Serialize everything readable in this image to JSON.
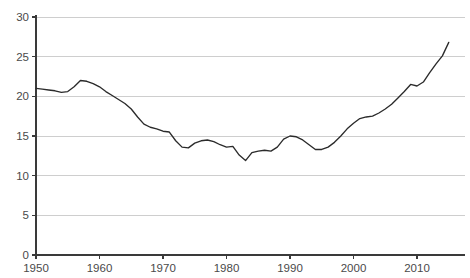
{
  "chart_data": {
    "type": "line",
    "title": "",
    "subtitle": "",
    "xlabel": "",
    "ylabel": "",
    "xlim": [
      1950,
      2015
    ],
    "ylim": [
      0,
      30
    ],
    "grid": true,
    "grid_axis": "y",
    "legend": false,
    "legend_position": "none",
    "line_color": "#2b2b2b",
    "grid_color": "#c9c9c9",
    "axis_color": "#3a3a3a",
    "label_color": "#4a4a4a",
    "background_color": "#ffffff",
    "y_ticks": [
      0,
      5,
      10,
      15,
      20,
      25,
      30
    ],
    "y_tick_labels": [
      "0",
      "5",
      "10",
      "15",
      "20",
      "25",
      "30"
    ],
    "x_ticks": [
      1950,
      1960,
      1970,
      1980,
      1990,
      2000,
      2010
    ],
    "x_tick_labels": [
      "1950",
      "1960",
      "1970",
      "1980",
      "1990",
      "2000",
      "2010"
    ],
    "series": [
      {
        "name": "series-1",
        "x": [
          1950,
          1951,
          1952,
          1953,
          1954,
          1955,
          1956,
          1957,
          1958,
          1959,
          1960,
          1961,
          1962,
          1963,
          1964,
          1965,
          1966,
          1967,
          1968,
          1969,
          1970,
          1971,
          1972,
          1973,
          1974,
          1975,
          1976,
          1977,
          1978,
          1979,
          1980,
          1981,
          1982,
          1983,
          1984,
          1985,
          1986,
          1987,
          1988,
          1989,
          1990,
          1991,
          1992,
          1993,
          1994,
          1995,
          1996,
          1997,
          1998,
          1999,
          2000,
          2001,
          2002,
          2003,
          2004,
          2005,
          2006,
          2007,
          2008,
          2009,
          2010,
          2011,
          2012,
          2013,
          2014,
          2015
        ],
        "values": [
          21.0,
          20.9,
          20.8,
          20.7,
          20.5,
          20.6,
          21.2,
          22.0,
          21.9,
          21.6,
          21.2,
          20.6,
          20.1,
          19.6,
          19.1,
          18.4,
          17.4,
          16.5,
          16.1,
          15.9,
          15.6,
          15.5,
          14.4,
          13.6,
          13.5,
          14.1,
          14.4,
          14.5,
          14.3,
          13.9,
          13.6,
          13.7,
          12.6,
          11.9,
          12.9,
          13.1,
          13.2,
          13.1,
          13.6,
          14.6,
          15.0,
          14.9,
          14.5,
          13.9,
          13.3,
          13.3,
          13.6,
          14.2,
          15.0,
          15.9,
          16.6,
          17.2,
          17.4,
          17.5,
          17.9,
          18.4,
          19.0,
          19.8,
          20.6,
          21.5,
          21.3,
          21.8,
          23.0,
          24.1,
          25.1,
          26.8
        ]
      }
    ]
  }
}
